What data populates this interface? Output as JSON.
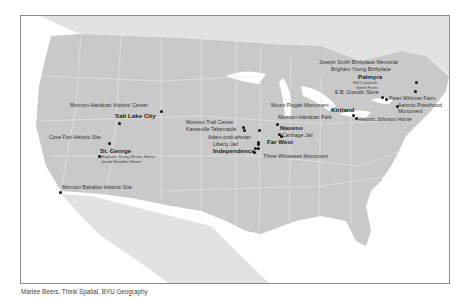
{
  "map": {
    "title": "Church History Sites in the United States",
    "colors": {
      "land_us": "#c9c9c9",
      "land_other": "#e2e2e2",
      "water": "#ffffff",
      "borders": "#e8e8e8",
      "frame": "#8a8a8a",
      "dot": "#111111"
    },
    "places": [
      {
        "id": "salt-lake-city",
        "label": "Salt Lake City",
        "style": "bold",
        "x": 114,
        "y": 115,
        "dot": [
          118,
          122
        ]
      },
      {
        "id": "mormon-handcart-visitors-center",
        "label": "Mormon Handcart Visitors' Center",
        "style": "normal",
        "x": 69,
        "y": 105,
        "dot": [
          160,
          110
        ]
      },
      {
        "id": "cove-fort",
        "label": "Cove Fort Historic Site",
        "style": "normal",
        "x": 48,
        "y": 137,
        "dot": [
          108,
          142
        ]
      },
      {
        "id": "st-george",
        "label": "St. George",
        "style": "bold",
        "x": 99,
        "y": 150,
        "dot": [
          98,
          155
        ]
      },
      {
        "id": "brigham-young-winter-home",
        "label": "Brigham Young Winter Home",
        "style": "small",
        "x": 100,
        "y": 157
      },
      {
        "id": "jacob-hamblin-home",
        "label": "Jacob Hamblin Home",
        "style": "small",
        "x": 100,
        "y": 162
      },
      {
        "id": "mormon-battalion",
        "label": "Mormon Battalion Historic Site",
        "style": "normal",
        "x": 61,
        "y": 187,
        "dot": [
          59,
          191
        ]
      },
      {
        "id": "mormon-trail-center",
        "label": "Mormon Trail Center",
        "style": "normal",
        "x": 185,
        "y": 122,
        "dot": [
          242,
          126
        ]
      },
      {
        "id": "kanesville-tabernacle",
        "label": "Kanesville Tabernacle",
        "style": "normal",
        "x": 185,
        "y": 129,
        "dot": [
          243,
          129
        ]
      },
      {
        "id": "adam-ondi-ahman",
        "label": "Adam-ondi-ahman",
        "style": "normal",
        "x": 207,
        "y": 137,
        "dot": [
          257,
          141
        ]
      },
      {
        "id": "liberty-jail",
        "label": "Liberty Jail",
        "style": "normal",
        "x": 212,
        "y": 144,
        "dot": [
          254,
          147
        ]
      },
      {
        "id": "far-west",
        "label": "Far West",
        "style": "bold",
        "x": 266,
        "y": 141,
        "dot": [
          257,
          143
        ]
      },
      {
        "id": "independence",
        "label": "Independence",
        "style": "bold",
        "x": 212,
        "y": 150,
        "dot": [
          253,
          151
        ]
      },
      {
        "id": "three-witnesses",
        "label": "Three Witnesses Monument",
        "style": "normal",
        "x": 262,
        "y": 156,
        "dot": [
          257,
          147
        ]
      },
      {
        "id": "mount-pisgah",
        "label": "Mount Pisgah Monument",
        "style": "normal",
        "x": 270,
        "y": 105,
        "dot": [
          258,
          129
        ]
      },
      {
        "id": "mormon-handcart-park",
        "label": "Mormon Handcart Park",
        "style": "normal",
        "x": 277,
        "y": 117,
        "dot": [
          276,
          123
        ]
      },
      {
        "id": "nauvoo",
        "label": "Nauvoo",
        "style": "bold",
        "x": 279,
        "y": 127,
        "dot": [
          278,
          133
        ]
      },
      {
        "id": "carthage-jail",
        "label": "Carthage Jail",
        "style": "normal",
        "x": 281,
        "y": 135,
        "dot": [
          280,
          135
        ]
      },
      {
        "id": "kirtland",
        "label": "Kirtland",
        "style": "bold",
        "x": 330,
        "y": 109,
        "dot": [
          352,
          114
        ]
      },
      {
        "id": "historic-johnson-home",
        "label": "Historic Johnson Home",
        "style": "normal",
        "x": 357,
        "y": 119,
        "dot": [
          355,
          117
        ]
      },
      {
        "id": "joseph-smith-birthplace",
        "label": "Joseph Smith Birthplace Memorial",
        "style": "normal",
        "x": 318,
        "y": 62,
        "dot": [
          415,
          81
        ]
      },
      {
        "id": "brigham-young-birthplace",
        "label": "Brigham Young Birthplace",
        "style": "normal",
        "x": 330,
        "y": 69,
        "dot": [
          414,
          90
        ]
      },
      {
        "id": "palmyra",
        "label": "Palmyra",
        "style": "bold",
        "x": 357,
        "y": 76
      },
      {
        "id": "hill-cumorah",
        "label": "Hill Cumorah",
        "style": "small",
        "x": 352,
        "y": 83
      },
      {
        "id": "smith-farm",
        "label": "Smith Farm",
        "style": "small",
        "x": 355,
        "y": 88
      },
      {
        "id": "eb-grandin-store",
        "label": "E.B. Grandin Store",
        "style": "normal",
        "x": 334,
        "y": 92,
        "dot": [
          381,
          96
        ]
      },
      {
        "id": "peter-whitmer-farm",
        "label": "Peter Whitmer Farm",
        "style": "normal",
        "x": 388,
        "y": 98,
        "dot": [
          385,
          98
        ]
      },
      {
        "id": "aaronic-priesthood",
        "label": "Aaronic Priesthood",
        "style": "normal",
        "x": 397,
        "y": 105,
        "dot": [
          396,
          105
        ]
      },
      {
        "id": "aaronic-priesthood-2",
        "label": "Monument",
        "style": "normal",
        "x": 397,
        "y": 111
      }
    ]
  },
  "credit": "Marlee Beers, Think Spatial, BYU Geography"
}
